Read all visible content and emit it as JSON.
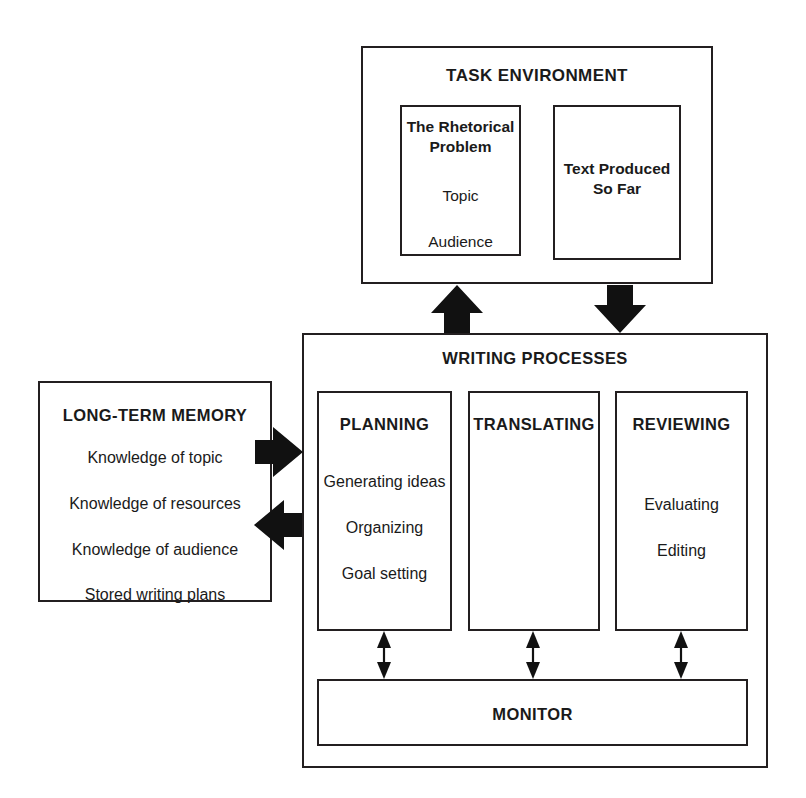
{
  "diagram": {
    "task_environment": {
      "heading": "TASK ENVIRONMENT",
      "rhetorical_problem": {
        "title_line1": "The Rhetorical",
        "title_line2": "Problem",
        "items": [
          "Topic",
          "Audience"
        ]
      },
      "text_produced": {
        "title_line1": "Text Produced",
        "title_line2": "So Far"
      }
    },
    "long_term_memory": {
      "heading": "LONG-TERM MEMORY",
      "items": [
        "Knowledge of topic",
        "Knowledge of resources",
        "Knowledge of audience",
        "Stored writing plans"
      ]
    },
    "writing_processes": {
      "heading": "WRITING PROCESSES",
      "columns": [
        {
          "heading": "PLANNING",
          "items": [
            "Generating ideas",
            "Organizing",
            "Goal setting"
          ]
        },
        {
          "heading": "TRANSLATING",
          "items": []
        },
        {
          "heading": "REVIEWING",
          "items": [
            "Evaluating",
            "Editing"
          ]
        }
      ],
      "monitor": {
        "heading": "MONITOR"
      }
    },
    "connectors": [
      {
        "name": "task-environment-to-writing-processes-down",
        "direction": "down",
        "style": "block"
      },
      {
        "name": "writing-processes-to-task-environment-up",
        "direction": "up",
        "style": "block"
      },
      {
        "name": "long-term-memory-to-planning-right",
        "direction": "right",
        "style": "block"
      },
      {
        "name": "writing-processes-to-long-term-memory-left",
        "direction": "left",
        "style": "block"
      },
      {
        "name": "planning-monitor-link",
        "direction": "bidirectional",
        "style": "thin"
      },
      {
        "name": "translating-monitor-link",
        "direction": "bidirectional",
        "style": "thin"
      },
      {
        "name": "reviewing-monitor-link",
        "direction": "bidirectional",
        "style": "thin"
      }
    ],
    "colors": {
      "stroke": "#231f20",
      "arrow_fill": "#111111",
      "background": "#ffffff",
      "text": "#1a1a1a"
    }
  }
}
